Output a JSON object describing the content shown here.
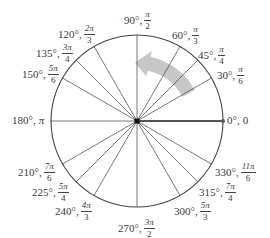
{
  "diagram": {
    "center": {
      "x": 137,
      "y": 121
    },
    "radius": 86,
    "colors": {
      "circle": "#444444",
      "spokes": "#555555",
      "zero_ray": "#555555",
      "arrow": "#bdbdbd",
      "center_dot": "#111111",
      "text": "#3a3a3a"
    },
    "arrow": {
      "description": "counterclockwise rotation arrow",
      "from_deg": 28,
      "to_deg": 78,
      "radius_frac": 0.68
    },
    "angles": [
      {
        "deg": 0,
        "degree_label": "0°,",
        "radian": {
          "type": "plain",
          "text": "0"
        },
        "pos": {
          "x": 227,
          "y": 115
        }
      },
      {
        "deg": 30,
        "degree_label": "30°,",
        "radian": {
          "type": "frac",
          "num": "π",
          "den": "6"
        },
        "pos": {
          "x": 217,
          "y": 65
        }
      },
      {
        "deg": 45,
        "degree_label": "45°,",
        "radian": {
          "type": "frac",
          "num": "π",
          "den": "4"
        },
        "pos": {
          "x": 198,
          "y": 45
        }
      },
      {
        "deg": 60,
        "degree_label": "60°,",
        "radian": {
          "type": "frac",
          "num": "π",
          "den": "3"
        },
        "pos": {
          "x": 172,
          "y": 25
        }
      },
      {
        "deg": 90,
        "degree_label": "90°,",
        "radian": {
          "type": "frac",
          "num": "π",
          "den": "2"
        },
        "pos": {
          "x": 124,
          "y": 10
        }
      },
      {
        "deg": 120,
        "degree_label": "120°,",
        "radian": {
          "type": "frac",
          "num": "2π",
          "den": "3"
        },
        "pos": {
          "x": 58,
          "y": 24
        }
      },
      {
        "deg": 135,
        "degree_label": "135°,",
        "radian": {
          "type": "frac",
          "num": "3π",
          "den": "4"
        },
        "pos": {
          "x": 36,
          "y": 43
        }
      },
      {
        "deg": 150,
        "degree_label": "150°,",
        "radian": {
          "type": "frac",
          "num": "5π",
          "den": "6"
        },
        "pos": {
          "x": 22,
          "y": 64
        }
      },
      {
        "deg": 180,
        "degree_label": "180°,",
        "radian": {
          "type": "plain",
          "text": "π"
        },
        "pos": {
          "x": 12,
          "y": 115
        }
      },
      {
        "deg": 210,
        "degree_label": "210°,",
        "radian": {
          "type": "frac",
          "num": "7π",
          "den": "6"
        },
        "pos": {
          "x": 18,
          "y": 162
        }
      },
      {
        "deg": 225,
        "degree_label": "225°,",
        "radian": {
          "type": "frac",
          "num": "5π",
          "den": "4"
        },
        "pos": {
          "x": 32,
          "y": 182
        }
      },
      {
        "deg": 240,
        "degree_label": "240°,",
        "radian": {
          "type": "frac",
          "num": "4π",
          "den": "3"
        },
        "pos": {
          "x": 55,
          "y": 201
        }
      },
      {
        "deg": 270,
        "degree_label": "270°,",
        "radian": {
          "type": "frac",
          "num": "3π",
          "den": "2"
        },
        "pos": {
          "x": 118,
          "y": 218
        }
      },
      {
        "deg": 300,
        "degree_label": "300°,",
        "radian": {
          "type": "frac",
          "num": "5π",
          "den": "3"
        },
        "pos": {
          "x": 174,
          "y": 201
        }
      },
      {
        "deg": 315,
        "degree_label": "315°,",
        "radian": {
          "type": "frac",
          "num": "7π",
          "den": "4"
        },
        "pos": {
          "x": 199,
          "y": 182
        }
      },
      {
        "deg": 330,
        "degree_label": "330°,",
        "radian": {
          "type": "frac",
          "num": "11π",
          "den": "6"
        },
        "pos": {
          "x": 215,
          "y": 162
        }
      }
    ]
  }
}
